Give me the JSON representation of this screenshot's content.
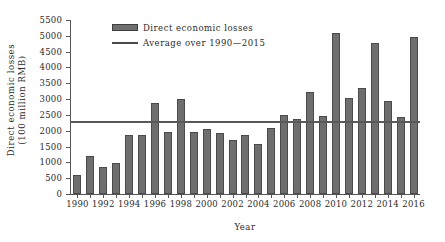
{
  "chart_data": {
    "type": "bar",
    "title": "",
    "xlabel": "Year",
    "ylabel": "Direct economic losses (100 million RMB)",
    "ylabel_line1": "Direct economic losses",
    "ylabel_line2": "(100 million RMB)",
    "ylim": [
      0,
      5500
    ],
    "ytick_step": 500,
    "yticks": [
      0,
      500,
      1000,
      1500,
      2000,
      2500,
      3000,
      3500,
      4000,
      4500,
      5000,
      5500
    ],
    "ytick_labels": [
      "0",
      "500",
      "1000",
      "1500",
      "2000",
      "2500",
      "3000",
      "3500",
      "4000",
      "4500",
      "5000",
      "5500"
    ],
    "grid": false,
    "legend_position": "upper-left-inside",
    "categories": [
      1990,
      1991,
      1992,
      1993,
      1994,
      1995,
      1996,
      1997,
      1998,
      1999,
      2000,
      2001,
      2002,
      2003,
      2004,
      2005,
      2006,
      2007,
      2008,
      2009,
      2010,
      2011,
      2012,
      2013,
      2014,
      2015,
      2016
    ],
    "xtick_labels": [
      "1990",
      "1992",
      "1994",
      "1996",
      "1998",
      "2000",
      "2002",
      "2004",
      "2006",
      "2008",
      "2010",
      "2012",
      "2014",
      "2016"
    ],
    "series": [
      {
        "name": "Direct economic losses",
        "type": "bar",
        "color": "#6e6e6e",
        "values": [
          600,
          1215,
          860,
          990,
          1875,
          1870,
          2880,
          1970,
          3000,
          1960,
          2040,
          1940,
          1720,
          1880,
          1570,
          2100,
          2500,
          2360,
          3230,
          2480,
          5080,
          3020,
          3340,
          4760,
          2940,
          2420,
          4960
        ]
      },
      {
        "name": "Average over 1990—2015",
        "type": "line",
        "color": "#595959",
        "value": 2320
      }
    ],
    "annotations": []
  },
  "legend": {
    "items": [
      {
        "label": "Direct economic losses",
        "marker": "bar-swatch"
      },
      {
        "label": "Average over 1990—2015",
        "marker": "line-swatch"
      }
    ]
  }
}
